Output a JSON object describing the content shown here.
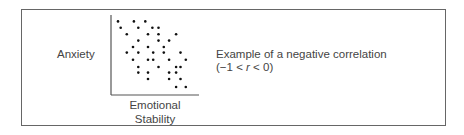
{
  "chart_data": {
    "type": "scatter",
    "title": "",
    "xlabel": "Emotional Stability",
    "ylabel": "Anxiety",
    "annotation": "Example of a negative correlation (−1 < r < 0)",
    "grid": false,
    "ticks": false,
    "xlim": [
      0,
      10
    ],
    "ylim": [
      0,
      10
    ],
    "points": [
      [
        0.8,
        9.2
      ],
      [
        2.6,
        9.2
      ],
      [
        3.9,
        9.2
      ],
      [
        1.1,
        8.4
      ],
      [
        3.1,
        8.4
      ],
      [
        4.7,
        8.4
      ],
      [
        5.4,
        8.4
      ],
      [
        1.8,
        7.6
      ],
      [
        4.2,
        7.6
      ],
      [
        5.4,
        7.6
      ],
      [
        7.4,
        7.6
      ],
      [
        3.1,
        6.8
      ],
      [
        5.4,
        6.8
      ],
      [
        6.6,
        6.8
      ],
      [
        2.5,
        6.0
      ],
      [
        4.2,
        6.0
      ],
      [
        6.0,
        6.0
      ],
      [
        1.8,
        5.3
      ],
      [
        3.1,
        5.3
      ],
      [
        4.8,
        5.3
      ],
      [
        6.0,
        5.3
      ],
      [
        7.9,
        5.3
      ],
      [
        2.5,
        4.4
      ],
      [
        4.2,
        4.4
      ],
      [
        4.8,
        4.4
      ],
      [
        6.6,
        4.4
      ],
      [
        8.5,
        4.4
      ],
      [
        3.1,
        3.5
      ],
      [
        5.4,
        3.5
      ],
      [
        7.4,
        3.5
      ],
      [
        7.9,
        3.5
      ],
      [
        3.1,
        2.8
      ],
      [
        4.2,
        2.8
      ],
      [
        6.6,
        2.8
      ],
      [
        7.4,
        2.8
      ],
      [
        4.2,
        2.0
      ],
      [
        6.6,
        2.0
      ],
      [
        7.9,
        2.0
      ],
      [
        7.4,
        1.0
      ],
      [
        8.5,
        1.0
      ]
    ]
  },
  "labels": {
    "y_axis": "Anxiety",
    "x_axis_line1": "Emotional",
    "x_axis_line2": "Stability",
    "caption_line1": "Example of a negative correlation",
    "caption_line2": "(−1 < r < 0)"
  },
  "colors": {
    "dots": "#111111",
    "axes": "#555555",
    "frame": "#666666"
  }
}
